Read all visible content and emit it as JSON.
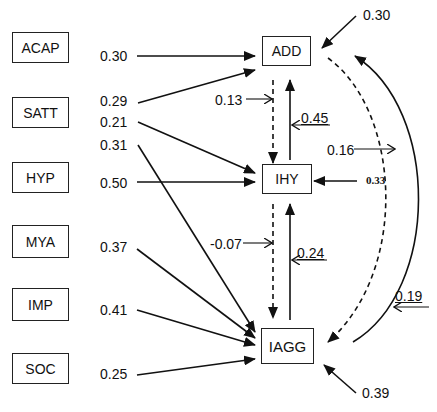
{
  "diagram": {
    "type": "path-model",
    "exogenous": [
      {
        "id": "ACAP",
        "label": "ACAP"
      },
      {
        "id": "SATT",
        "label": "SATT"
      },
      {
        "id": "HYP",
        "label": "HYP"
      },
      {
        "id": "MYA",
        "label": "MYA"
      },
      {
        "id": "IMP",
        "label": "IMP"
      },
      {
        "id": "SOC",
        "label": "SOC"
      }
    ],
    "endogenous": [
      {
        "id": "ADD",
        "label": "ADD"
      },
      {
        "id": "IHY",
        "label": "IHY"
      },
      {
        "id": "IAGG",
        "label": "IAGG"
      }
    ],
    "paths": [
      {
        "from": "ACAP",
        "to": "ADD",
        "coef": "0.30"
      },
      {
        "from": "SATT",
        "to": "ADD",
        "coef": "0.29"
      },
      {
        "from": "SATT",
        "to": "IHY",
        "coef": "0.21"
      },
      {
        "from": "SATT",
        "to": "IAGG",
        "coef": "0.31"
      },
      {
        "from": "HYP",
        "to": "IHY",
        "coef": "0.50"
      },
      {
        "from": "MYA",
        "to": "IAGG",
        "coef": "0.37"
      },
      {
        "from": "IMP",
        "to": "IAGG",
        "coef": "0.41"
      },
      {
        "from": "SOC",
        "to": "IAGG",
        "coef": "0.25"
      },
      {
        "from": "ADD",
        "to": "IHY",
        "coef": "0.13",
        "style": "dashed"
      },
      {
        "from": "IHY",
        "to": "ADD",
        "coef": "0.45"
      },
      {
        "from": "IHY",
        "to": "IAGG",
        "coef": "-0.07",
        "style": "dashed"
      },
      {
        "from": "IAGG",
        "to": "IHY",
        "coef": "0.24"
      },
      {
        "from": "ADD",
        "to": "IAGG",
        "coef": "0.16",
        "style": "dashed-curved"
      },
      {
        "from": "IAGG",
        "to": "ADD",
        "coef": "0.19",
        "style": "curved"
      }
    ],
    "residuals": [
      {
        "target": "ADD",
        "value": "0.30"
      },
      {
        "target": "IHY",
        "value": "0.33"
      },
      {
        "target": "IAGG",
        "value": "0.39"
      }
    ]
  }
}
